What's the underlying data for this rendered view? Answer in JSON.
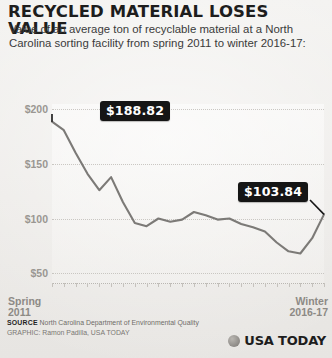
{
  "title": "RECYCLED MATERIAL LOSES VALUE",
  "subtitle": "Value of an average ton of recyclable material at a North Carolina sorting facility from spring 2011 to winter 2016-17:",
  "callouts": {
    "start": "$188.82",
    "end": "$103.84"
  },
  "axis": {
    "x_left_line1": "Spring",
    "x_left_line2": "2011",
    "x_right_line1": "Winter",
    "x_right_line2": "2016-17"
  },
  "footer": {
    "source_label": "SOURCE",
    "source_text": "North Carolina Department of Environmental Quality",
    "credit": "GRAPHIC: Ramon Padilla, USA TODAY"
  },
  "logo": {
    "text": "USA TODAY",
    "mark": "globe-icon"
  },
  "colors": {
    "line": "#7c7a77",
    "callout_bg": "#151515",
    "callout_text": "#ffffff",
    "paper": "#efeeec",
    "grid": "#c2bfba"
  },
  "chart_data": {
    "type": "line",
    "title": "RECYCLED MATERIAL LOSES VALUE",
    "subtitle": "Value of an average ton of recyclable material at a North Carolina sorting facility from spring 2011 to winter 2016-17:",
    "xlabel": "",
    "ylabel": "",
    "ylim": [
      40,
      205
    ],
    "yticks": [
      50,
      100,
      150,
      200
    ],
    "ytick_labels": [
      "$50",
      "$100",
      "$150",
      "$200"
    ],
    "grid": true,
    "legend": false,
    "x_start": "Spring 2011",
    "x_end": "Winter 2016-17",
    "x": [
      "Spring 2011",
      "Summer 2011",
      "Fall 2011",
      "Winter 2011-12",
      "Spring 2012",
      "Summer 2012",
      "Fall 2012",
      "Winter 2012-13",
      "Spring 2013",
      "Summer 2013",
      "Fall 2013",
      "Winter 2013-14",
      "Spring 2014",
      "Summer 2014",
      "Fall 2014",
      "Winter 2014-15",
      "Spring 2015",
      "Summer 2015",
      "Fall 2015",
      "Winter 2015-16",
      "Spring 2016",
      "Summer 2016",
      "Fall 2016",
      "Winter 2016-17"
    ],
    "values": [
      188.82,
      181.0,
      160.0,
      141.0,
      126.0,
      138.0,
      115.0,
      96.0,
      93.0,
      100.0,
      97.0,
      99.0,
      106.0,
      103.0,
      99.0,
      100.0,
      95.0,
      92.0,
      88.0,
      78.0,
      70.0,
      68.0,
      82.0,
      103.84
    ],
    "annotations": [
      {
        "label": "$188.82",
        "x": "Spring 2011",
        "y": 188.82
      },
      {
        "label": "$103.84",
        "x": "Winter 2016-17",
        "y": 103.84
      }
    ]
  }
}
